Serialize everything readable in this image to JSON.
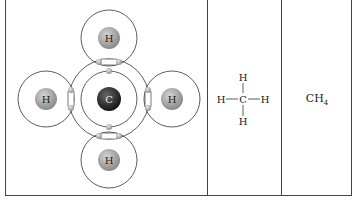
{
  "panels": {
    "electron_dot": {
      "central_atom": "C",
      "outer_atoms": [
        "H",
        "H",
        "H",
        "H"
      ],
      "colors": {
        "carbon": "#2a2a2a",
        "hydrogen": "#9a9a9a",
        "electron": "#a8a8a8",
        "orbit": "#333333"
      }
    },
    "structural": {
      "center": "C",
      "top": "H",
      "bottom": "H",
      "left": "H",
      "right": "H"
    },
    "molecular": {
      "formula_base": "CH",
      "formula_sub": "4"
    }
  }
}
